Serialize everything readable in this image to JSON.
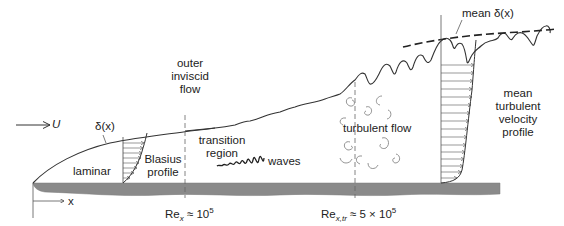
{
  "diagram": {
    "labels": {
      "freestream_velocity": "U",
      "delta_x": "δ(x)",
      "mean_delta_x": "mean δ(x)",
      "outer_flow_1": "outer",
      "outer_flow_2": "inviscid",
      "outer_flow_3": "flow",
      "laminar": "laminar",
      "blasius_1": "Blasius",
      "blasius_2": "profile",
      "transition_1": "transition",
      "transition_2": "region",
      "waves": "waves",
      "turbulent_flow": "turbulent flow",
      "mean_turb_1": "mean",
      "mean_turb_2": "turbulent",
      "mean_turb_3": "velocity",
      "mean_turb_4": "profile",
      "x_axis": "x",
      "re_crit_prefix": "Re",
      "re_crit_sub": "x",
      "re_crit_approx": " ≈ 10",
      "re_crit_exp": "5",
      "re_tr_prefix": "Re",
      "re_tr_sub": "x,tr",
      "re_tr_approx": " ≈ 5 × 10",
      "re_tr_exp": "5"
    },
    "markers": {
      "re_critical_x": 185,
      "re_transition_x": 355
    },
    "colors": {
      "line": "#333333",
      "plate": "#8a8a8a",
      "text": "#222222",
      "eddy": "#888888"
    }
  }
}
